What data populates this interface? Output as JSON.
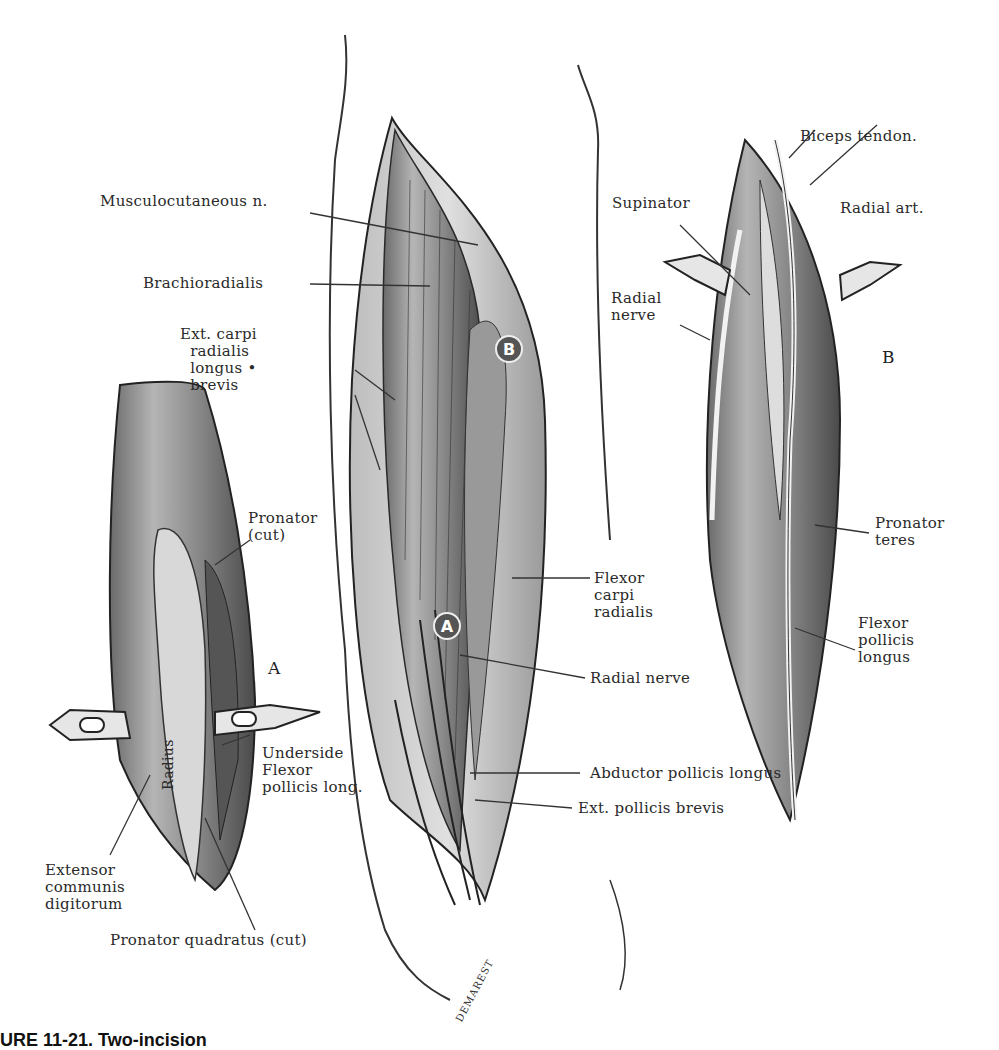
{
  "figure": {
    "caption_partial": "URE 11-21.  Two-incision",
    "signature": "DEMAREST",
    "panels": {
      "left": {
        "id": "A",
        "labels": {
          "pronator_cut": "Pronator\n(cut)",
          "radius": "Radius",
          "underside_flexor": "Underside\nFlexor\npollicis long.",
          "extensor_communis": "Extensor\ncommunis\ndigitorum",
          "pronator_quadratus": "Pronator quadratus (cut)"
        }
      },
      "center": {
        "marker_a": "A",
        "marker_b": "B",
        "labels": {
          "musculocutaneous": "Musculocutaneous n.",
          "brachioradialis": "Brachioradialis",
          "ext_carpi": "Ext. carpi\n  radialis\n  longus •\n  brevis",
          "flexor_carpi_radialis": "Flexor\ncarpi\nradialis",
          "radial_nerve": "Radial  nerve",
          "abductor_pollicis": "Abductor pollicis longus",
          "ext_pollicis_brevis": "Ext. pollicis brevis"
        }
      },
      "right": {
        "id": "B",
        "labels": {
          "biceps_tendon": "Biceps tendon.",
          "supinator": "Supinator",
          "radial_art": "Radial art.",
          "radial_nerve": "Radial\nnerve",
          "pronator_teres": "Pronator\nteres",
          "flexor_pollicis_longus": "Flexor\npollicis\nlongus"
        }
      }
    }
  }
}
